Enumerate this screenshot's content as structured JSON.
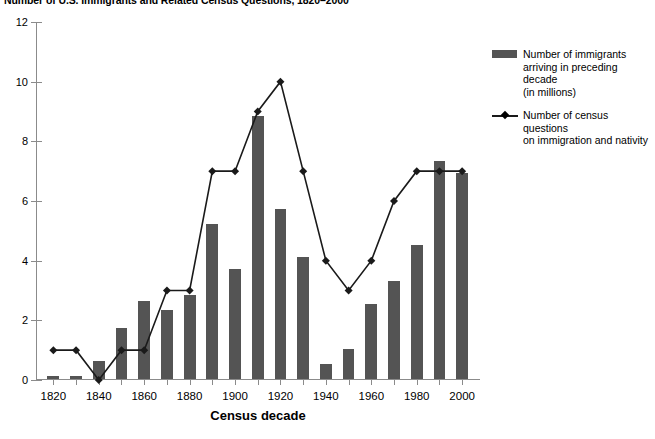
{
  "chart_data": {
    "type": "bar",
    "title": "Number of U.S. Immigrants and Related Census Questions, 1820–2000",
    "xlabel": "Census decade",
    "ylabel": "",
    "ylim": [
      0,
      12
    ],
    "ytick_step": 2,
    "ytick_labels": [
      "0",
      "2",
      "4",
      "6",
      "8",
      "10",
      "12"
    ],
    "grid": false,
    "legend_position": "right",
    "categories": [
      1820,
      1830,
      1840,
      1850,
      1860,
      1870,
      1880,
      1890,
      1900,
      1910,
      1920,
      1930,
      1940,
      1950,
      1960,
      1970,
      1980,
      1990,
      2000
    ],
    "xtick_labels_shown": [
      "1820",
      "",
      "1840",
      "",
      "1860",
      "",
      "1880",
      "",
      "1900",
      "",
      "1920",
      "",
      "1940",
      "",
      "1960",
      "",
      "1980",
      "",
      "2000"
    ],
    "series": [
      {
        "name": "Number of immigrants arriving in preceding decade (in millions)",
        "type": "bar",
        "color": "#545454",
        "values": [
          0.1,
          0.1,
          0.6,
          1.7,
          2.6,
          2.3,
          2.8,
          5.2,
          3.7,
          8.8,
          5.7,
          4.1,
          0.5,
          1.0,
          2.5,
          3.3,
          4.5,
          7.3,
          6.9
        ]
      },
      {
        "name": "Number of census questions on immigration and nativity",
        "type": "line",
        "color": "#1a1a1a",
        "marker": "diamond",
        "values": [
          1,
          1,
          0,
          1,
          1,
          3,
          3,
          7,
          7,
          9,
          10,
          7,
          4,
          3,
          4,
          6,
          7,
          7,
          7
        ]
      }
    ]
  },
  "legend": {
    "entries": [
      {
        "marker": "bar-swatch",
        "lines": [
          "Number of immigrants",
          "arriving in preceding decade",
          "(in millions)"
        ]
      },
      {
        "marker": "line-diamond",
        "lines": [
          "Number of census questions",
          "on immigration and nativity"
        ]
      }
    ]
  },
  "colors": {
    "bar": "#545454",
    "line": "#1a1a1a",
    "axis": "#8b8b8b",
    "background": "#ffffff"
  }
}
